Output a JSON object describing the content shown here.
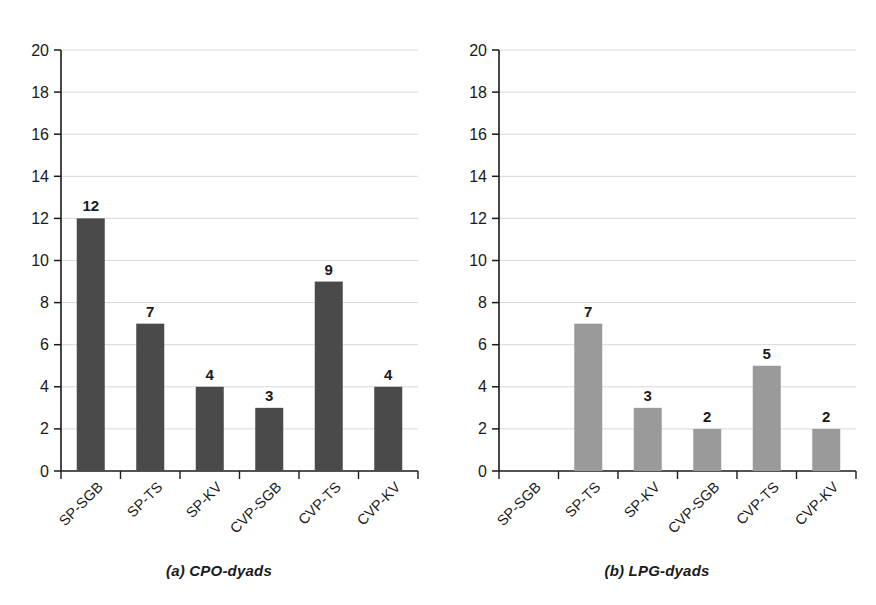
{
  "figure": {
    "background_color": "#ffffff",
    "axis_color": "#1a1a1a",
    "grid_color": "#d8d8d8"
  },
  "panels": [
    {
      "id": "a",
      "caption": "(a) CPO-dyads",
      "bar_color": "#4a4a4a"
    },
    {
      "id": "b",
      "caption": "(b) LPG-dyads",
      "bar_color": "#9a9a9a"
    }
  ],
  "chart_data": [
    {
      "type": "bar",
      "title": "(a) CPO-dyads",
      "xlabel": "",
      "ylabel": "",
      "categories": [
        "SP-SGB",
        "SP-TS",
        "SP-KV",
        "CVP-SGB",
        "CVP-TS",
        "CVP-KV"
      ],
      "values": [
        12,
        7,
        4,
        3,
        9,
        4
      ],
      "value_labels": [
        "12",
        "7",
        "4",
        "3",
        "9",
        "4"
      ],
      "ylim": [
        0,
        20
      ],
      "ytick_values": [
        0,
        2,
        4,
        6,
        8,
        10,
        12,
        14,
        16,
        18,
        20
      ],
      "ytick_labels": [
        "0",
        "2",
        "4",
        "6",
        "8",
        "10",
        "12",
        "14",
        "16",
        "18",
        "20"
      ],
      "grid": true,
      "legend": false,
      "bar_color": "#4a4a4a"
    },
    {
      "type": "bar",
      "title": "(b) LPG-dyads",
      "xlabel": "",
      "ylabel": "",
      "categories": [
        "SP-SGB",
        "SP-TS",
        "SP-KV",
        "CVP-SGB",
        "CVP-TS",
        "CVP-KV"
      ],
      "values": [
        0,
        7,
        3,
        2,
        5,
        2
      ],
      "value_labels": [
        "",
        "7",
        "3",
        "2",
        "5",
        "2"
      ],
      "ylim": [
        0,
        20
      ],
      "ytick_values": [
        0,
        2,
        4,
        6,
        8,
        10,
        12,
        14,
        16,
        18,
        20
      ],
      "ytick_labels": [
        "0",
        "2",
        "4",
        "6",
        "8",
        "10",
        "12",
        "14",
        "16",
        "18",
        "20"
      ],
      "grid": true,
      "legend": false,
      "bar_color": "#9a9a9a"
    }
  ]
}
